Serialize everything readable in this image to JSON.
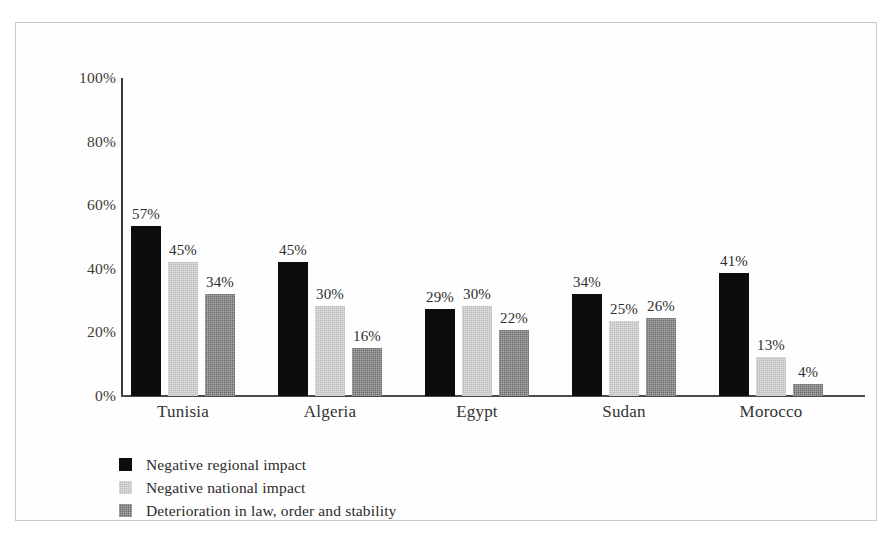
{
  "chart_data": {
    "type": "bar",
    "title": "",
    "subtitle": "",
    "xlabel": "",
    "ylabel": "",
    "categories": [
      "Tunisia",
      "Algeria",
      "Egypt",
      "Sudan",
      "Morocco"
    ],
    "series": [
      {
        "name": "Negative regional impact",
        "color": "#0d0d0d",
        "values": [
          57,
          45,
          29,
          34,
          41
        ],
        "labels": [
          "57%",
          "45%",
          "29%",
          "34%",
          "41%"
        ]
      },
      {
        "name": "Negative national impact",
        "color": "#bcbcbc",
        "values": [
          45,
          30,
          30,
          25,
          13
        ],
        "labels": [
          "45%",
          "30%",
          "30%",
          "25%",
          "13%"
        ]
      },
      {
        "name": "Deterioration in law, order and stability",
        "color": "#6e6e6e",
        "values": [
          34,
          16,
          22,
          26,
          4
        ],
        "labels": [
          "34%",
          "16%",
          "22%",
          "26%",
          "4%"
        ]
      }
    ],
    "ylim": [
      0,
      100
    ],
    "ytick_values": [
      100,
      80,
      60,
      40,
      20,
      0
    ],
    "ytick_labels": [
      "100%",
      "80%",
      "60%",
      "40%",
      "20%",
      "0%"
    ],
    "grid": false,
    "legend_position": "bottom-left",
    "value_labels_shown": true
  },
  "legend": {
    "entries": [
      "Negative regional impact",
      "Negative national impact",
      "Deterioration in law, order and stability"
    ]
  }
}
